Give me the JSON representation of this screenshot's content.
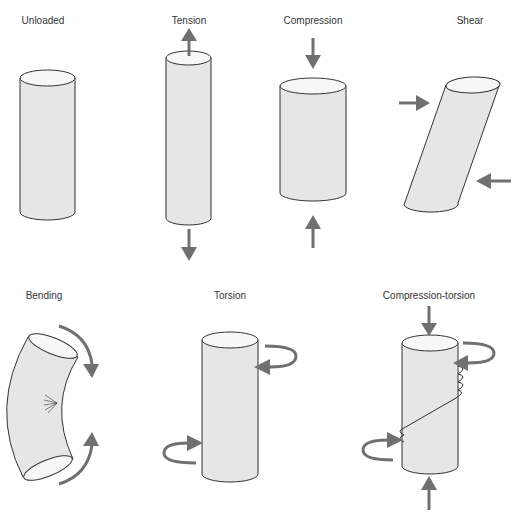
{
  "diagram": {
    "colors": {
      "background": "#ffffff",
      "cylinder_fill": "#e6e6e6",
      "cylinder_top": "#f7f7f7",
      "outline": "#333333",
      "arrow": "#707070",
      "label": "#333333"
    },
    "panels": [
      {
        "id": "unloaded",
        "label": "Unloaded"
      },
      {
        "id": "tension",
        "label": "Tension"
      },
      {
        "id": "compression",
        "label": "Compression"
      },
      {
        "id": "shear",
        "label": "Shear"
      },
      {
        "id": "bending",
        "label": "Bending"
      },
      {
        "id": "torsion",
        "label": "Torsion"
      },
      {
        "id": "compression-torsion",
        "label": "Compression-torsion"
      }
    ]
  }
}
